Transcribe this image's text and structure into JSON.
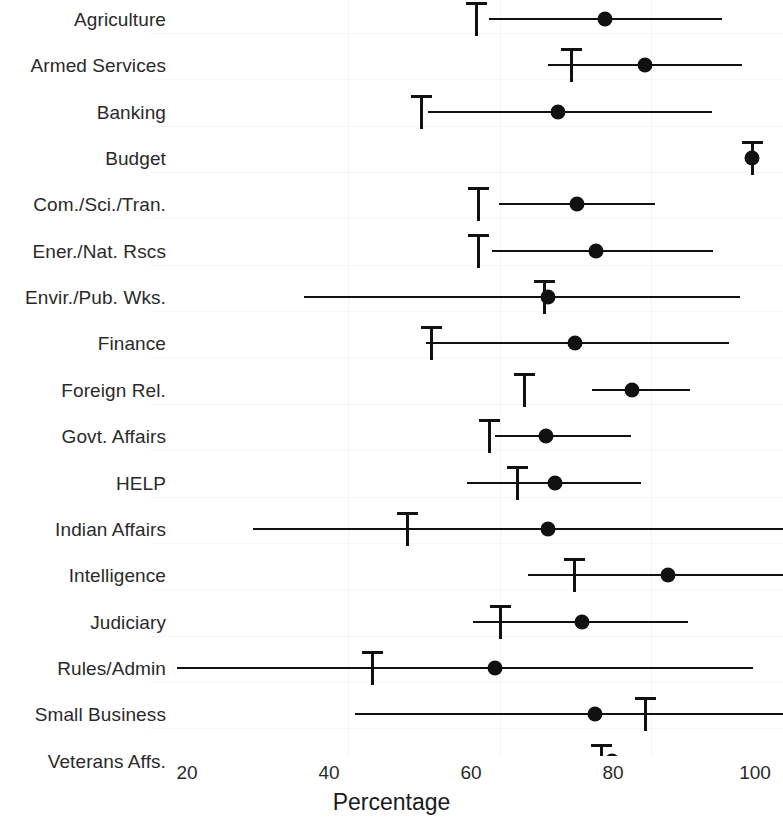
{
  "chart_data": {
    "type": "scatter",
    "title": "",
    "subtitle": "",
    "xlabel": "Percentage",
    "ylabel": "",
    "xlim": [
      14,
      102
    ],
    "xticks": [
      20,
      40,
      60,
      80,
      100
    ],
    "xtick_labels": [
      "20",
      "40",
      "60",
      "80",
      "100"
    ],
    "grid": false,
    "legend": "none",
    "orientation": "horizontal",
    "marker_legend": {
      "dot": "point estimate",
      "tick": "reference tick marker",
      "line": "interval range"
    },
    "categories": [
      "Agriculture",
      "Armed Services",
      "Banking",
      "Budget",
      "Com./Sci./Tran.",
      "Ener./Nat. Rscs",
      "Envir./Pub. Wks.",
      "Finance",
      "Foreign Rel.",
      "Govt. Affairs",
      "HELP",
      "Indian Affairs",
      "Intelligence",
      "Judiciary",
      "Rules/Admin",
      "Small Business",
      "Veterans Affs."
    ],
    "series": [
      {
        "name": "point estimate",
        "values": [
          78.9,
          84.5,
          72.3,
          99.6,
          74.9,
          77.6,
          70.9,
          74.7,
          82.7,
          70.6,
          71.9,
          70.9,
          87.7,
          75.6,
          63.4,
          77.4,
          79.8
        ]
      },
      {
        "name": "tick marker",
        "values": [
          60.8,
          74.2,
          53.0,
          99.6,
          61.0,
          61.0,
          70.3,
          54.5,
          67.5,
          62.6,
          66.5,
          51.1,
          74.6,
          64.1,
          46.1,
          84.6,
          78.4
        ]
      },
      {
        "name": "interval low",
        "values": [
          62.6,
          70.8,
          54.0,
          98.8,
          64.0,
          62.9,
          36.5,
          53.7,
          77.1,
          63.4,
          59.5,
          29.3,
          68.0,
          60.3,
          18.6,
          43.6,
          54.5
        ]
      },
      {
        "name": "interval high",
        "values": [
          95.4,
          98.2,
          93.9,
          100.4,
          85.9,
          94.1,
          97.9,
          96.3,
          90.8,
          82.6,
          83.9,
          104.0,
          104.0,
          90.6,
          99.7,
          104.0,
          104.0
        ]
      }
    ]
  }
}
